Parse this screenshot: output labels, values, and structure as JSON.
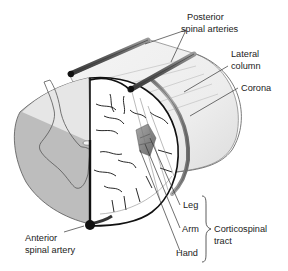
{
  "diagram": {
    "labels": {
      "posterior_spinal_arteries_line1": "Posterior",
      "posterior_spinal_arteries_line2": "spinal arteries",
      "lateral_column_line1": "Lateral",
      "lateral_column_line2": "column",
      "corona": "Corona",
      "leg": "Leg",
      "arm": "Arm",
      "hand": "Hand",
      "corticospinal_tract_line1": "Corticospinal",
      "corticospinal_tract_line2": "tract",
      "anterior_spinal_artery_line1": "Anterior",
      "anterior_spinal_artery_line2": "spinal artery"
    },
    "colors": {
      "background": "#ffffff",
      "white_matter_light": "#e6e6e6",
      "white_matter_shaded": "#bdbdbd",
      "gray_matter_outline": "#555555",
      "artery_dark": "#111111",
      "artery_tube": "#6f6f6f",
      "cylinder_body": "#f2f2f2",
      "tract_shading": "#8a8a8a",
      "label_text": "#222222"
    }
  }
}
